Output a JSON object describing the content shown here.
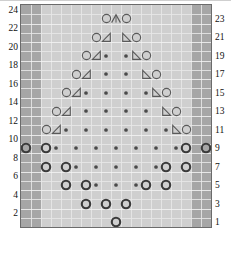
{
  "chart_data": {
    "type": "table",
    "title": "",
    "grid": {
      "columns": 19,
      "rows": 24
    },
    "row_numbers_left": [
      24,
      22,
      20,
      18,
      16,
      14,
      12,
      10,
      8,
      6,
      4,
      2
    ],
    "row_numbers_right": [
      23,
      21,
      19,
      17,
      15,
      13,
      11,
      9,
      7,
      5,
      3,
      1
    ],
    "legend_symbols": {
      "o": "yarn-over-open-circle",
      "O": "yarn-over-bold-circle",
      "dot": "purl-dot",
      "rtri": "right-leaning-decrease-triangle",
      "ltri": "left-leaning-decrease-triangle",
      "peak": "double-decrease-peak"
    },
    "shaded_border_columns": {
      "left": [
        0,
        1
      ],
      "right": [
        17,
        18
      ]
    },
    "rows": [
      {
        "number": 23,
        "cells": [
          {
            "col": 8,
            "sym": "o"
          },
          {
            "col": 9,
            "sym": "peak"
          },
          {
            "col": 10,
            "sym": "o"
          }
        ]
      },
      {
        "number": 21,
        "cells": [
          {
            "col": 7,
            "sym": "o"
          },
          {
            "col": 8,
            "sym": "rtri"
          },
          {
            "col": 10,
            "sym": "ltri"
          },
          {
            "col": 11,
            "sym": "o"
          }
        ]
      },
      {
        "number": 19,
        "cells": [
          {
            "col": 6,
            "sym": "o"
          },
          {
            "col": 7,
            "sym": "rtri"
          },
          {
            "col": 8,
            "sym": "dot"
          },
          {
            "col": 10,
            "sym": "dot"
          },
          {
            "col": 11,
            "sym": "ltri"
          },
          {
            "col": 12,
            "sym": "o"
          }
        ]
      },
      {
        "number": 17,
        "cells": [
          {
            "col": 5,
            "sym": "o"
          },
          {
            "col": 6,
            "sym": "rtri"
          },
          {
            "col": 8,
            "sym": "dot"
          },
          {
            "col": 10,
            "sym": "dot"
          },
          {
            "col": 12,
            "sym": "ltri"
          },
          {
            "col": 13,
            "sym": "o"
          }
        ]
      },
      {
        "number": 15,
        "cells": [
          {
            "col": 4,
            "sym": "o"
          },
          {
            "col": 5,
            "sym": "rtri"
          },
          {
            "col": 6,
            "sym": "dot"
          },
          {
            "col": 8,
            "sym": "dot"
          },
          {
            "col": 10,
            "sym": "dot"
          },
          {
            "col": 12,
            "sym": "dot"
          },
          {
            "col": 13,
            "sym": "ltri"
          },
          {
            "col": 14,
            "sym": "o"
          }
        ]
      },
      {
        "number": 13,
        "cells": [
          {
            "col": 3,
            "sym": "o"
          },
          {
            "col": 4,
            "sym": "rtri"
          },
          {
            "col": 6,
            "sym": "dot"
          },
          {
            "col": 8,
            "sym": "dot"
          },
          {
            "col": 10,
            "sym": "dot"
          },
          {
            "col": 12,
            "sym": "dot"
          },
          {
            "col": 14,
            "sym": "ltri"
          },
          {
            "col": 15,
            "sym": "o"
          }
        ]
      },
      {
        "number": 11,
        "cells": [
          {
            "col": 2,
            "sym": "o"
          },
          {
            "col": 3,
            "sym": "rtri"
          },
          {
            "col": 4,
            "sym": "dot"
          },
          {
            "col": 6,
            "sym": "dot"
          },
          {
            "col": 8,
            "sym": "dot"
          },
          {
            "col": 10,
            "sym": "dot"
          },
          {
            "col": 12,
            "sym": "dot"
          },
          {
            "col": 14,
            "sym": "dot"
          },
          {
            "col": 15,
            "sym": "ltri"
          },
          {
            "col": 16,
            "sym": "o"
          }
        ]
      },
      {
        "number": 9,
        "cells": [
          {
            "col": 0,
            "sym": "O"
          },
          {
            "col": 2,
            "sym": "O"
          },
          {
            "col": 3,
            "sym": "dot"
          },
          {
            "col": 5,
            "sym": "dot"
          },
          {
            "col": 7,
            "sym": "dot"
          },
          {
            "col": 9,
            "sym": "dot"
          },
          {
            "col": 11,
            "sym": "dot"
          },
          {
            "col": 13,
            "sym": "dot"
          },
          {
            "col": 15,
            "sym": "dot"
          },
          {
            "col": 16,
            "sym": "O"
          },
          {
            "col": 18,
            "sym": "O"
          }
        ]
      },
      {
        "number": 7,
        "cells": [
          {
            "col": 2,
            "sym": "O"
          },
          {
            "col": 4,
            "sym": "O"
          },
          {
            "col": 5,
            "sym": "dot"
          },
          {
            "col": 7,
            "sym": "dot"
          },
          {
            "col": 9,
            "sym": "dot"
          },
          {
            "col": 11,
            "sym": "dot"
          },
          {
            "col": 13,
            "sym": "dot"
          },
          {
            "col": 14,
            "sym": "O"
          },
          {
            "col": 16,
            "sym": "O"
          }
        ]
      },
      {
        "number": 5,
        "cells": [
          {
            "col": 4,
            "sym": "O"
          },
          {
            "col": 6,
            "sym": "O"
          },
          {
            "col": 7,
            "sym": "dot"
          },
          {
            "col": 9,
            "sym": "dot"
          },
          {
            "col": 11,
            "sym": "dot"
          },
          {
            "col": 12,
            "sym": "O"
          },
          {
            "col": 14,
            "sym": "O"
          }
        ]
      },
      {
        "number": 3,
        "cells": [
          {
            "col": 6,
            "sym": "O"
          },
          {
            "col": 8,
            "sym": "O"
          },
          {
            "col": 10,
            "sym": "O"
          }
        ]
      },
      {
        "number": 1,
        "cells": [
          {
            "col": 9,
            "sym": "O"
          }
        ]
      }
    ]
  },
  "bracket": {
    "label": "",
    "start_col": 2,
    "end_col": 17
  }
}
